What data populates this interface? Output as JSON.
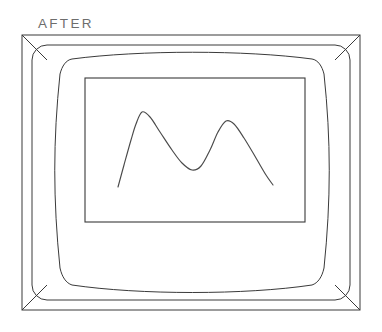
{
  "page": {
    "title": "AFTER",
    "width": 382,
    "height": 332,
    "background_color": "#ffffff",
    "line_color": "#3a3a3a",
    "caption_color": "#6d6d6d"
  },
  "caption": {
    "label": "AFTER",
    "x": 38,
    "y": 28
  },
  "figure": {
    "casing": {
      "name": "monitor-outer-casing",
      "x": 22,
      "y": 35,
      "width": 338,
      "height": 275
    },
    "bezel": {
      "name": "monitor-inner-bezel",
      "x": 32,
      "y": 45,
      "width": 318,
      "height": 255,
      "corner_radius": 15
    },
    "bevel_corners": [
      {
        "name": "bevel-top-left",
        "from": [
          22,
          35
        ],
        "to": [
          47,
          60
        ]
      },
      {
        "name": "bevel-top-right",
        "from": [
          360,
          35
        ],
        "to": [
          335,
          60
        ]
      },
      {
        "name": "bevel-bottom-left",
        "from": [
          22,
          310
        ],
        "to": [
          47,
          285
        ]
      },
      {
        "name": "bevel-bottom-right",
        "from": [
          360,
          310
        ],
        "to": [
          335,
          285
        ]
      }
    ],
    "crt_screen": {
      "name": "crt-screen-outline",
      "note": "barrel-distorted rounded rectangle bulging outward on all four sides",
      "bounds": {
        "left": 55,
        "top": 58,
        "right": 328,
        "bottom": 288
      }
    },
    "display_area": {
      "name": "display-inner-rectangle",
      "x": 85,
      "y": 78,
      "width": 220,
      "height": 144
    }
  },
  "chart_data": {
    "type": "line",
    "title": "",
    "subtitle": "",
    "xlabel": "",
    "ylabel": "",
    "grid": false,
    "legend": null,
    "axes_visible": false,
    "note": "Unlabeled twin-peak waveform trace drawn inside the monitor display area. Coordinates are in screenshot pixel space; y increases downward.",
    "xlim": [
      85,
      305
    ],
    "ylim": [
      222,
      78
    ],
    "series": [
      {
        "name": "waveform-trace",
        "color": "#4a4a4a",
        "points": [
          {
            "x": 118,
            "y": 187,
            "role": "start"
          },
          {
            "x": 124,
            "y": 165
          },
          {
            "x": 131,
            "y": 140
          },
          {
            "x": 136,
            "y": 124
          },
          {
            "x": 142,
            "y": 112,
            "role": "peak-1"
          },
          {
            "x": 150,
            "y": 117
          },
          {
            "x": 160,
            "y": 132
          },
          {
            "x": 172,
            "y": 150
          },
          {
            "x": 182,
            "y": 163
          },
          {
            "x": 192,
            "y": 170,
            "role": "valley"
          },
          {
            "x": 201,
            "y": 166
          },
          {
            "x": 210,
            "y": 150
          },
          {
            "x": 218,
            "y": 132
          },
          {
            "x": 226,
            "y": 121,
            "role": "peak-2"
          },
          {
            "x": 234,
            "y": 124
          },
          {
            "x": 244,
            "y": 138
          },
          {
            "x": 256,
            "y": 158
          },
          {
            "x": 266,
            "y": 175
          },
          {
            "x": 273,
            "y": 185,
            "role": "end"
          }
        ]
      }
    ],
    "peaks": [
      {
        "label": "peak-1",
        "x": 142,
        "y": 112,
        "relative_height": "taller"
      },
      {
        "label": "peak-2",
        "x": 226,
        "y": 121,
        "relative_height": "shorter"
      }
    ],
    "valleys": [
      {
        "label": "valley",
        "x": 192,
        "y": 170
      }
    ]
  }
}
